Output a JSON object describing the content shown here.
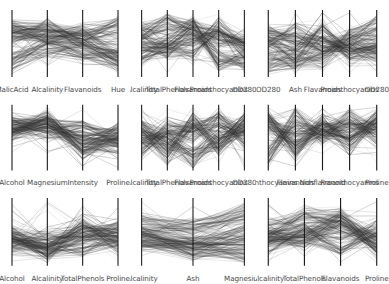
{
  "figure": {
    "type": "parallel-coordinates-grid",
    "rows": 3,
    "cols": 3,
    "background": "#ffffff",
    "line_color": "#333333",
    "axis_color": "#1a1a1a",
    "label_color": "#4a4a4a",
    "n_lines_per_panel": 178,
    "dataset_hint": "Wine"
  },
  "chart_data": {
    "type": "line",
    "title": "",
    "xlabel": "",
    "ylabel": "",
    "grid": false,
    "legend": "none",
    "panels": [
      {
        "index": 0,
        "row": 0,
        "col": 0,
        "axes": [
          "MalicAcid",
          "Alcalinity",
          "Flavanoids",
          "Hue"
        ],
        "n_axes": 4,
        "n_lines": 178,
        "ylim": [
          0,
          1
        ]
      },
      {
        "index": 1,
        "row": 0,
        "col": 1,
        "axes": [
          "Alcalinity",
          "TotalPhenols",
          "Flavanoids",
          "Proanthocyanins",
          "OD280"
        ],
        "n_axes": 5,
        "n_lines": 178,
        "ylim": [
          0,
          1
        ]
      },
      {
        "index": 2,
        "row": 0,
        "col": 2,
        "axes": [
          "OD280",
          "Ash",
          "Flavanoids",
          "Proanthocyanins",
          "OD280"
        ],
        "n_axes": 5,
        "n_lines": 178,
        "ylim": [
          0,
          1
        ]
      },
      {
        "index": 3,
        "row": 1,
        "col": 0,
        "axes": [
          "Alcohol",
          "Magnesium",
          "Intensity",
          "Proline"
        ],
        "n_axes": 4,
        "n_lines": 178,
        "ylim": [
          0,
          1
        ]
      },
      {
        "index": 4,
        "row": 1,
        "col": 1,
        "axes": [
          "Alcalinity",
          "TotalPhenols",
          "Flavanoids",
          "Proanthocyanins",
          "OD280"
        ],
        "n_axes": 5,
        "n_lines": 178,
        "ylim": [
          0,
          1
        ]
      },
      {
        "index": 5,
        "row": 1,
        "col": 2,
        "axes": [
          "Proanthocyanins",
          "Flavanoids",
          "Nonflavanoid",
          "Proanthocyanins",
          "Proline"
        ],
        "n_axes": 5,
        "n_lines": 178,
        "ylim": [
          0,
          1
        ]
      },
      {
        "index": 6,
        "row": 2,
        "col": 0,
        "axes": [
          "Alcohol",
          "Alcalinity",
          "TotalPhenols",
          "Proline"
        ],
        "n_axes": 4,
        "n_lines": 178,
        "ylim": [
          0,
          1
        ]
      },
      {
        "index": 7,
        "row": 2,
        "col": 1,
        "axes": [
          "Alcalinity",
          "Ash",
          "Magnesium"
        ],
        "n_axes": 3,
        "n_lines": 178,
        "ylim": [
          0,
          1
        ]
      },
      {
        "index": 8,
        "row": 2,
        "col": 2,
        "axes": [
          "Alcalinity",
          "TotalPhenols",
          "Flavanoids",
          "Proline"
        ],
        "n_axes": 4,
        "n_lines": 178,
        "ylim": [
          0,
          1
        ]
      }
    ]
  }
}
